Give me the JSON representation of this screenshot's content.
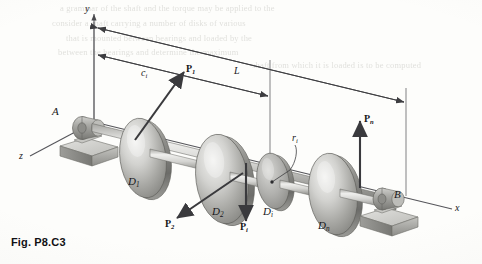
{
  "figure": {
    "caption": "Fig. P8.C3"
  },
  "axes": [
    {
      "name": "y-axis",
      "label": "y"
    },
    {
      "name": "z-axis",
      "label": "z"
    },
    {
      "name": "x-axis",
      "label": "x"
    }
  ],
  "supports": [
    {
      "name": "bearing-a",
      "label": "A"
    },
    {
      "name": "bearing-b",
      "label": "B"
    }
  ],
  "dimensions": [
    {
      "name": "dimension-ci",
      "label": "c",
      "sub": "i"
    },
    {
      "name": "dimension-l",
      "label": "L",
      "sub": ""
    }
  ],
  "radius": {
    "name": "radius-ri",
    "label": "r",
    "sub": "i"
  },
  "disks": [
    {
      "name": "disk-1",
      "label": "D",
      "sub": "1"
    },
    {
      "name": "disk-2",
      "label": "D",
      "sub": "2"
    },
    {
      "name": "disk-i",
      "label": "D",
      "sub": "i"
    },
    {
      "name": "disk-n",
      "label": "D",
      "sub": "n"
    }
  ],
  "forces": [
    {
      "name": "force-p1",
      "label": "P",
      "sub": "1"
    },
    {
      "name": "force-p2",
      "label": "P",
      "sub": "2"
    },
    {
      "name": "force-pi",
      "label": "P",
      "sub": "i"
    },
    {
      "name": "force-pn",
      "label": "P",
      "sub": "n"
    }
  ],
  "bleed_through": [
    "a grammar of the shaft and the torque may be applied to the",
    "consider a shaft carrying a number of disks of various",
    "that is mounted between bearings and loaded by the",
    "between the bearings and determine the maximum",
    "shaft from which it is loaded is to be computed"
  ],
  "colors": {
    "paper": "#fdfdfb",
    "ink": "#17171a",
    "metal_light": "#e8e8e6",
    "metal_mid": "#a9a9a6",
    "metal_dark": "#707070",
    "line": "#4a4a4d"
  }
}
